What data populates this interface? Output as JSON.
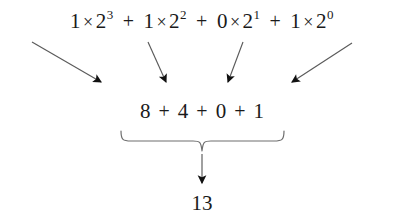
{
  "diagram": {
    "background_color": "#ffffff",
    "text_color": "#1a1a1a",
    "arrow_color": "#5a5a5a",
    "brace_color": "#6e6e6e",
    "expansion": {
      "terms": [
        {
          "coefficient": "1",
          "operator": "×",
          "base": "2",
          "exponent": "3"
        },
        {
          "coefficient": "1",
          "operator": "×",
          "base": "2",
          "exponent": "2"
        },
        {
          "coefficient": "0",
          "operator": "×",
          "base": "2",
          "exponent": "1"
        },
        {
          "coefficient": "1",
          "operator": "×",
          "base": "2",
          "exponent": "0"
        }
      ],
      "separators": [
        "+",
        "+",
        "+"
      ]
    },
    "values": {
      "items": [
        "8",
        "4",
        "0",
        "1"
      ],
      "separators": [
        "+",
        "+",
        "+"
      ]
    },
    "result": "13"
  }
}
